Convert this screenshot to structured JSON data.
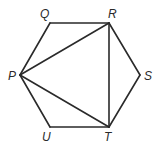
{
  "diagram": {
    "type": "regular hexagon with diagonals",
    "vertices": [
      {
        "name": "Q",
        "x": 50,
        "y": 23,
        "label_x": 40,
        "label_y": 8
      },
      {
        "name": "R",
        "x": 109,
        "y": 23,
        "label_x": 108,
        "label_y": 8
      },
      {
        "name": "S",
        "x": 140,
        "y": 75,
        "label_x": 144,
        "label_y": 70
      },
      {
        "name": "T",
        "x": 109,
        "y": 127,
        "label_x": 104,
        "label_y": 131
      },
      {
        "name": "U",
        "x": 50,
        "y": 127,
        "label_x": 42,
        "label_y": 131
      },
      {
        "name": "P",
        "x": 20,
        "y": 75,
        "label_x": 8,
        "label_y": 70
      }
    ],
    "edges": [
      [
        "Q",
        "R"
      ],
      [
        "R",
        "S"
      ],
      [
        "S",
        "T"
      ],
      [
        "T",
        "U"
      ],
      [
        "U",
        "P"
      ],
      [
        "P",
        "Q"
      ],
      [
        "P",
        "R"
      ],
      [
        "P",
        "T"
      ],
      [
        "R",
        "T"
      ]
    ],
    "labels": {
      "Q": "Q",
      "R": "R",
      "S": "S",
      "T": "T",
      "U": "U",
      "P": "P"
    },
    "stroke_color": "#2a2a2a"
  }
}
